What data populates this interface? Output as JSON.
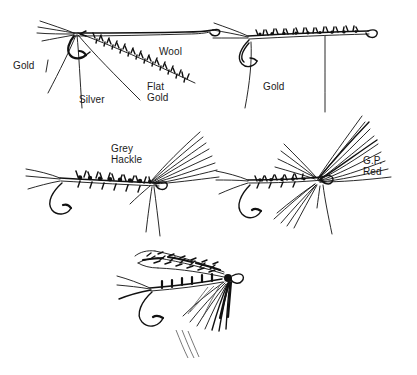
{
  "figure": {
    "background_color": "#ffffff",
    "ink_color": "#111111",
    "width": 417,
    "height": 375
  },
  "flies": [
    {
      "id": "fly-top-left",
      "name": "Top left fly — exploded materials",
      "labels": [
        "Gold",
        "Silver",
        "Flat Gold",
        "Wool"
      ]
    },
    {
      "id": "fly-top-right",
      "name": "Top right fly — gold ribbed body",
      "labels": [
        "Gold"
      ]
    },
    {
      "id": "fly-mid-left",
      "name": "Middle left fly — grey hackle wing",
      "labels": [
        "Grey Hackle"
      ]
    },
    {
      "id": "fly-mid-right",
      "name": "Middle right fly — golden pheasant red",
      "labels": [
        "G.P. Red"
      ]
    },
    {
      "id": "fly-bottom",
      "name": "Bottom fly — finished dressed fly",
      "labels": []
    }
  ],
  "labels": {
    "gold_left": "Gold",
    "silver": "Silver",
    "flat_gold_line1": "Flat",
    "flat_gold_line2": "Gold",
    "wool": "Wool",
    "gold_right": "Gold",
    "grey_hackle_line1": "Grey",
    "grey_hackle_line2": "Hackle",
    "gp_red_line1": "G.P.",
    "gp_red_line2": "Red"
  }
}
